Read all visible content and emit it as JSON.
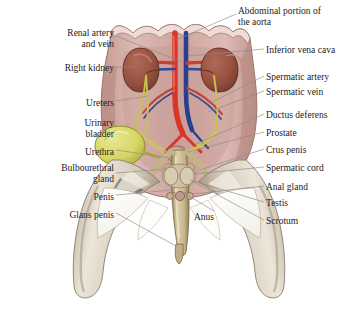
{
  "figure": {
    "background_color": "#ffffff",
    "leader_line_color": "#8a8a88",
    "text_color": "#23201e"
  },
  "palette": {
    "body_wall": "#d6b3ad",
    "body_wall_dark": "#b98e88",
    "muscle_limb": "#cfc6b6",
    "muscle_limb_light": "#e6e0d3",
    "muscle_limb_dark": "#a89c89",
    "kidney": "#a05a4c",
    "kidney_dark": "#7d4137",
    "aorta_red": "#d9352a",
    "vena_cava_blue": "#2b3f8c",
    "ureter_yellow": "#c9c24a",
    "bladder_yellow": "#d7d86a",
    "bladder_edge": "#9a9a33",
    "penis_tan": "#cfc09a",
    "penis_tan_dark": "#a8946c",
    "cut_white": "#fbfaf7"
  },
  "labels_left": [
    {
      "id": "renal-artery-and-vein",
      "text": "Renal artery\nand vein",
      "x": 12,
      "y": 28,
      "w": 102,
      "align": "right"
    },
    {
      "id": "right-kidney",
      "text": "Right kidney",
      "x": 12,
      "y": 63,
      "w": 102,
      "align": "right"
    },
    {
      "id": "ureters",
      "text": "Ureters",
      "x": 12,
      "y": 98,
      "w": 102,
      "align": "right"
    },
    {
      "id": "urinary-bladder",
      "text": "Urinary\nbladder",
      "x": 12,
      "y": 118,
      "w": 102,
      "align": "right"
    },
    {
      "id": "urethra",
      "text": "Urethra",
      "x": 12,
      "y": 147,
      "w": 102,
      "align": "right"
    },
    {
      "id": "bulbourethral-gland",
      "text": "Bulbourethral\ngland",
      "x": 4,
      "y": 163,
      "w": 110,
      "align": "right"
    },
    {
      "id": "penis",
      "text": "Penis",
      "x": 12,
      "y": 192,
      "w": 102,
      "align": "right"
    },
    {
      "id": "glans-penis",
      "text": "Glans penis",
      "x": 12,
      "y": 210,
      "w": 102,
      "align": "right"
    }
  ],
  "labels_right": [
    {
      "id": "abdominal-portion-of-the-aorta",
      "text": "Abdominal portion of\nthe aorta",
      "x": 238,
      "y": 6,
      "w": 118,
      "align": "left"
    },
    {
      "id": "inferior-vena-cava",
      "text": "Inferior vena cava",
      "x": 266,
      "y": 45,
      "w": 92,
      "align": "left"
    },
    {
      "id": "spermatic-artery",
      "text": "Spermatic artery",
      "x": 266,
      "y": 72,
      "w": 92,
      "align": "left"
    },
    {
      "id": "spermatic-vein",
      "text": "Spermatic vein",
      "x": 266,
      "y": 87,
      "w": 92,
      "align": "left"
    },
    {
      "id": "ductus-deferens",
      "text": "Ductus deferens",
      "x": 266,
      "y": 110,
      "w": 92,
      "align": "left"
    },
    {
      "id": "prostate",
      "text": "Prostate",
      "x": 266,
      "y": 128,
      "w": 92,
      "align": "left"
    },
    {
      "id": "crus-penis",
      "text": "Crus penis",
      "x": 266,
      "y": 145,
      "w": 92,
      "align": "left"
    },
    {
      "id": "spermatic-cord",
      "text": "Spermatic cord",
      "x": 266,
      "y": 163,
      "w": 92,
      "align": "left"
    },
    {
      "id": "anal-gland",
      "text": "Anal gland",
      "x": 266,
      "y": 182,
      "w": 92,
      "align": "left"
    },
    {
      "id": "testis",
      "text": "Testis",
      "x": 266,
      "y": 198,
      "w": 92,
      "align": "left"
    },
    {
      "id": "scrotum",
      "text": "Scrotum",
      "x": 266,
      "y": 216,
      "w": 92,
      "align": "left"
    }
  ],
  "labels_inner": [
    {
      "id": "anus",
      "text": "Anus",
      "x": 194,
      "y": 212,
      "w": 34,
      "align": "left"
    }
  ]
}
